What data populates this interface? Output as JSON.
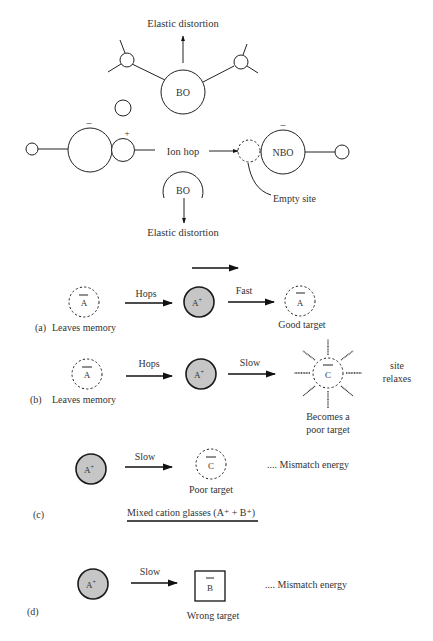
{
  "figure": {
    "top": {
      "elastic_top_label": "Elastic distortion",
      "elastic_bottom_label": "Elastic distortion",
      "bo_top_label": "BO",
      "bo_bottom_label": "BO",
      "ion_hop_label": "Ion hop",
      "nbo_label": "NBO",
      "empty_site_label": "Empty site",
      "minus_sign": "–",
      "plus_sign": "+"
    },
    "panel_a": {
      "tag": "(a)",
      "source_symbol": "A",
      "source_caption": "Leaves memory",
      "hop_label": "Hops",
      "ion_label": "A",
      "ion_charge": "+",
      "rate_label": "Fast",
      "target_symbol": "A",
      "target_caption": "Good target"
    },
    "panel_b": {
      "tag": "(b)",
      "source_symbol": "A",
      "source_caption": "Leaves memory",
      "hop_label": "Hops",
      "ion_label": "A",
      "ion_charge": "+",
      "rate_label": "Slow",
      "target_symbol": "C",
      "target_caption_line1": "Becomes a",
      "target_caption_line2": "poor target",
      "side_note_line1": "site",
      "side_note_line2": "relaxes"
    },
    "panel_c": {
      "tag": "(c)",
      "ion_label": "A",
      "ion_charge": "+",
      "rate_label": "Slow",
      "target_symbol": "C",
      "target_caption": "Poor target",
      "note": ".... Mismatch energy",
      "section_heading": "Mixed cation glasses (A⁺ + B⁺)"
    },
    "panel_d": {
      "tag": "(d)",
      "ion_label": "A",
      "ion_charge": "+",
      "rate_label": "Slow",
      "target_symbol": "B",
      "target_caption": "Wrong target",
      "note": ".... Mismatch energy"
    },
    "colors": {
      "ion_fill": "#c6c6c6",
      "stroke": "#222222",
      "text": "#333333"
    }
  }
}
